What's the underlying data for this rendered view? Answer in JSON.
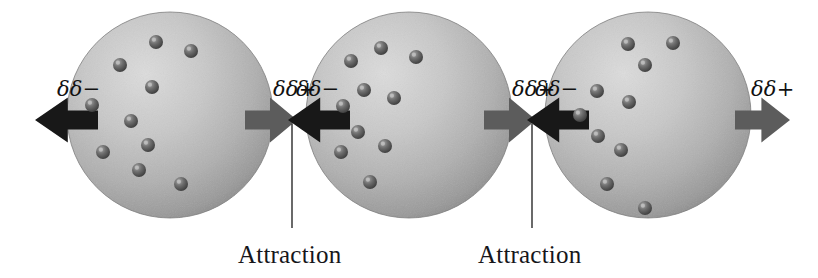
{
  "figure": {
    "background_color": "#ffffff",
    "width": 818,
    "height": 278
  },
  "colors": {
    "sphere_light": "#d6d6d6",
    "sphere_mid": "#b4b4b4",
    "sphere_dark": "#8e8e8e",
    "sphere_edge": "#7a7a7a",
    "electron_light": "#9a9a9a",
    "electron_dark": "#4a4a4a",
    "arrow_negative": "#181818",
    "arrow_positive": "#5c5c5c",
    "text": "#16161a",
    "leader_line": "#2a2a2a"
  },
  "labels": {
    "negative": "δδ−",
    "positive": "δδ+",
    "attraction": "Attraction"
  },
  "atoms": [
    {
      "name": "atom-1",
      "cx": 170,
      "cy": 115,
      "r": 103,
      "negative_label": "δδ−",
      "positive_label": "δδ+",
      "negative_label_x": 57,
      "negative_label_y": 96,
      "positive_label_x": 273,
      "positive_label_y": 96,
      "electrons": [
        {
          "x": 156,
          "y": 42,
          "r": 7
        },
        {
          "x": 191,
          "y": 51,
          "r": 7
        },
        {
          "x": 120,
          "y": 65,
          "r": 7
        },
        {
          "x": 152,
          "y": 87,
          "r": 7
        },
        {
          "x": 92,
          "y": 105,
          "r": 7
        },
        {
          "x": 131,
          "y": 121,
          "r": 7
        },
        {
          "x": 148,
          "y": 145,
          "r": 7
        },
        {
          "x": 103,
          "y": 152,
          "r": 7
        },
        {
          "x": 139,
          "y": 170,
          "r": 7
        },
        {
          "x": 181,
          "y": 184,
          "r": 7
        }
      ]
    },
    {
      "name": "atom-2",
      "cx": 409,
      "cy": 115,
      "r": 103,
      "negative_label": "δδ−",
      "positive_label": "δδ+",
      "negative_label_x": 296,
      "negative_label_y": 96,
      "positive_label_x": 512,
      "positive_label_y": 96,
      "electrons": [
        {
          "x": 381,
          "y": 48,
          "r": 7
        },
        {
          "x": 416,
          "y": 57,
          "r": 7
        },
        {
          "x": 351,
          "y": 61,
          "r": 7
        },
        {
          "x": 364,
          "y": 90,
          "r": 7
        },
        {
          "x": 394,
          "y": 98,
          "r": 7
        },
        {
          "x": 343,
          "y": 106,
          "r": 7
        },
        {
          "x": 358,
          "y": 132,
          "r": 7
        },
        {
          "x": 385,
          "y": 146,
          "r": 7
        },
        {
          "x": 341,
          "y": 152,
          "r": 7
        },
        {
          "x": 370,
          "y": 182,
          "r": 7
        }
      ]
    },
    {
      "name": "atom-3",
      "cx": 648,
      "cy": 115,
      "r": 103,
      "negative_label": "δδ−",
      "positive_label": "δδ+",
      "negative_label_x": 535,
      "negative_label_y": 96,
      "positive_label_x": 751,
      "positive_label_y": 96,
      "electrons": [
        {
          "x": 628,
          "y": 44,
          "r": 7
        },
        {
          "x": 673,
          "y": 43,
          "r": 7
        },
        {
          "x": 645,
          "y": 65,
          "r": 7
        },
        {
          "x": 597,
          "y": 91,
          "r": 7
        },
        {
          "x": 629,
          "y": 102,
          "r": 7
        },
        {
          "x": 580,
          "y": 115,
          "r": 7
        },
        {
          "x": 598,
          "y": 136,
          "r": 7
        },
        {
          "x": 621,
          "y": 150,
          "r": 7
        },
        {
          "x": 607,
          "y": 184,
          "r": 7
        },
        {
          "x": 645,
          "y": 208,
          "r": 7
        }
      ]
    }
  ],
  "arrows": [
    {
      "name": "arrow-atom1-negative",
      "polarity": "negative",
      "direction": "left",
      "tip_x": 35,
      "tail_x": 98,
      "cy": 120
    },
    {
      "name": "arrow-atom1-positive",
      "polarity": "positive",
      "direction": "right",
      "tip_x": 297,
      "tail_x": 245,
      "cy": 120
    },
    {
      "name": "arrow-atom2-negative",
      "polarity": "negative",
      "direction": "left",
      "tip_x": 288,
      "tail_x": 350,
      "cy": 120
    },
    {
      "name": "arrow-atom2-positive",
      "polarity": "positive",
      "direction": "right",
      "tip_x": 536,
      "tail_x": 484,
      "cy": 120
    },
    {
      "name": "arrow-atom3-negative",
      "polarity": "negative",
      "direction": "left",
      "tip_x": 527,
      "tail_x": 589,
      "cy": 120
    },
    {
      "name": "arrow-atom3-positive",
      "polarity": "positive",
      "direction": "right",
      "tip_x": 790,
      "tail_x": 735,
      "cy": 120
    }
  ],
  "attractions": [
    {
      "name": "attraction-1",
      "label": "Attraction",
      "leader_x": 292,
      "leader_y_top": 124,
      "leader_y_bottom": 228,
      "text_x": 238,
      "text_y": 263
    },
    {
      "name": "attraction-2",
      "label": "Attraction",
      "leader_x": 532,
      "leader_y_top": 124,
      "leader_y_bottom": 228,
      "text_x": 478,
      "text_y": 263
    }
  ]
}
